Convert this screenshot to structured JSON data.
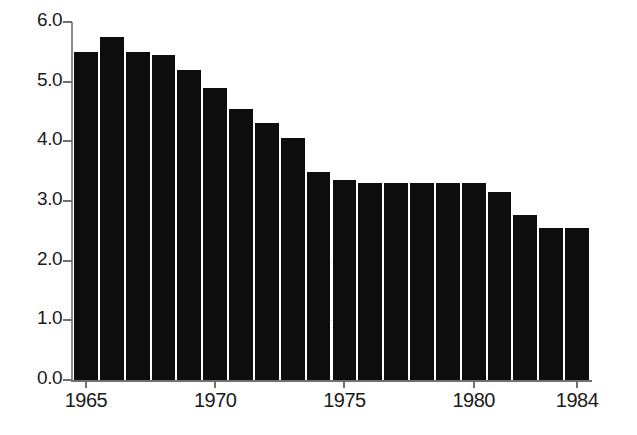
{
  "chart_data": {
    "type": "bar",
    "title": "",
    "subtitle": "",
    "xlabel": "",
    "ylabel": "",
    "categories": [
      "1965",
      "1966",
      "1967",
      "1968",
      "1969",
      "1970",
      "1971",
      "1972",
      "1973",
      "1974",
      "1975",
      "1976",
      "1977",
      "1978",
      "1979",
      "1980",
      "1981",
      "1982",
      "1983",
      "1984"
    ],
    "values": [
      5.5,
      5.75,
      5.5,
      5.45,
      5.2,
      4.9,
      4.55,
      4.3,
      4.05,
      3.48,
      3.35,
      3.3,
      3.3,
      3.3,
      3.3,
      3.3,
      3.15,
      2.77,
      2.55,
      2.55
    ],
    "x_tick_labels": [
      "1965",
      "1970",
      "1975",
      "1980",
      "1984"
    ],
    "x_tick_categories": [
      "1965",
      "1970",
      "1975",
      "1980",
      "1984"
    ],
    "y_tick_labels": [
      "0.0",
      "1.0",
      "2.0",
      "3.0",
      "4.0",
      "5.0",
      "6.0"
    ],
    "y_tick_values": [
      0,
      1,
      2,
      3,
      4,
      5,
      6
    ],
    "ylim": [
      0.0,
      6.0
    ],
    "grid": true,
    "gridlines_at": [
      1.0,
      2.0
    ],
    "legend": [],
    "legend_position": "none",
    "annotations": [],
    "bar_color": "#0d0d0d",
    "axis_color": "#6f6f6f",
    "background_color": "#ffffff"
  }
}
